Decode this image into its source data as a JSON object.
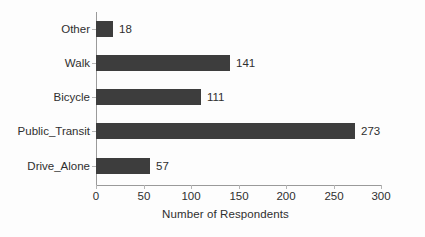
{
  "chart_data": {
    "type": "bar",
    "orientation": "horizontal",
    "title": "",
    "xlabel": "Number of Respondents",
    "ylabel": "",
    "categories": [
      "Other",
      "Walk",
      "Bicycle",
      "Public_Transit",
      "Drive_Alone"
    ],
    "values": [
      18,
      141,
      111,
      273,
      57
    ],
    "value_labels": [
      "18",
      "141",
      "111",
      "273",
      "57"
    ],
    "xlim": [
      0,
      300
    ],
    "xticks": [
      0,
      50,
      100,
      150,
      200,
      250,
      300
    ],
    "xtick_labels": [
      "0",
      "50",
      "100",
      "150",
      "200",
      "250",
      "300"
    ],
    "grid": false,
    "legend": null,
    "bar_color": "#3d3d3d",
    "axis_color": "#9a9a9a",
    "text_color": "#2f2f2f",
    "background_color": "#fdfdfd"
  },
  "bars": [
    {
      "category": "Other",
      "value": 18,
      "label": "18"
    },
    {
      "category": "Walk",
      "value": 141,
      "label": "141"
    },
    {
      "category": "Bicycle",
      "value": 111,
      "label": "111"
    },
    {
      "category": "Public_Transit",
      "value": 273,
      "label": "273"
    },
    {
      "category": "Drive_Alone",
      "value": 57,
      "label": "57"
    }
  ],
  "xticks": [
    {
      "value": 0,
      "label": "0"
    },
    {
      "value": 50,
      "label": "50"
    },
    {
      "value": 100,
      "label": "100"
    },
    {
      "value": 150,
      "label": "150"
    },
    {
      "value": 200,
      "label": "200"
    },
    {
      "value": 250,
      "label": "250"
    },
    {
      "value": 300,
      "label": "300"
    }
  ],
  "axis": {
    "x_title": "Number of Respondents"
  }
}
